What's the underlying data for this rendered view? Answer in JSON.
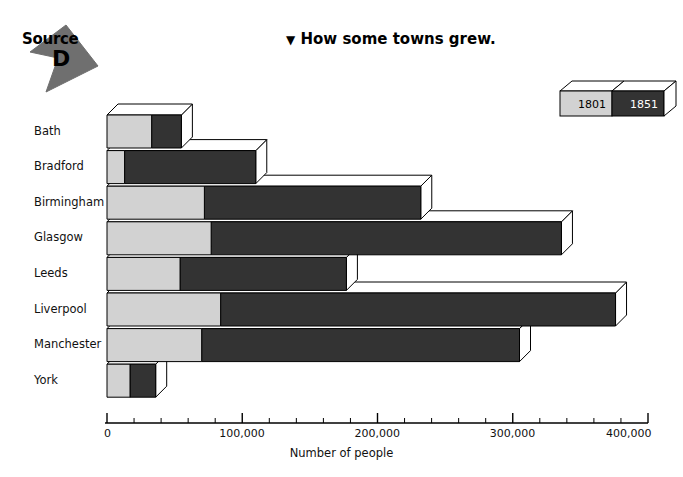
{
  "source": {
    "word": "Source",
    "letter": "D",
    "arrow_icon": "source-arrow-icon"
  },
  "header": {
    "marker": "▼",
    "title": "How some towns grew."
  },
  "legend": {
    "position": "top-right",
    "entries": [
      {
        "label": "1801",
        "color": "#d2d2d2",
        "text_color": "#000000"
      },
      {
        "label": "1851",
        "color": "#333333",
        "text_color": "#ffffff"
      }
    ]
  },
  "chart_data": {
    "type": "bar",
    "orientation": "horizontal",
    "title": "How some towns grew.",
    "xlabel": "Number of people",
    "ylabel": "",
    "xlim": [
      0,
      400000
    ],
    "xticks": [
      0,
      100000,
      200000,
      300000,
      400000
    ],
    "xtick_labels": [
      "0",
      "100,000",
      "200,000",
      "300,000",
      "400,000"
    ],
    "minor_tick_interval": 20000,
    "grid": false,
    "legend_position": "top-right",
    "categories": [
      "Bath",
      "Bradford",
      "Birmingham",
      "Glasgow",
      "Leeds",
      "Liverpool",
      "Manchester",
      "York"
    ],
    "series": [
      {
        "name": "1801",
        "color": "#d2d2d2",
        "values": [
          33000,
          13000,
          72000,
          77000,
          54000,
          84000,
          70000,
          17000
        ]
      },
      {
        "name": "1851",
        "color": "#333333",
        "values": [
          55000,
          110000,
          232000,
          336000,
          177000,
          376000,
          305000,
          36000
        ]
      }
    ]
  },
  "axis": {
    "label": "Number of people"
  },
  "colors": {
    "light_bar": "#d2d2d2",
    "dark_bar": "#333333",
    "outline": "#000000",
    "top_face": "#ffffff",
    "background": "#ffffff"
  }
}
